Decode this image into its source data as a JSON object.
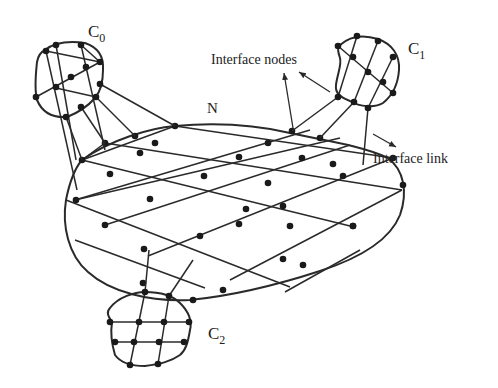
{
  "diagram": {
    "labels": {
      "c0": "C",
      "c0_sub": "0",
      "c1": "C",
      "c1_sub": "1",
      "c2": "C",
      "c2_sub": "2",
      "n": "N",
      "interface_nodes": "Interface nodes",
      "interface_link": "Interface link"
    },
    "colors": {
      "line": "#2a2a2a",
      "node": "#1a1a1a",
      "background": "#ffffff"
    },
    "components": [
      {
        "id": "N",
        "description": "central network (ellipse with mesh grid)"
      },
      {
        "id": "C0",
        "description": "upper-left cluster"
      },
      {
        "id": "C1",
        "description": "upper-right cluster"
      },
      {
        "id": "C2",
        "description": "bottom cluster"
      }
    ]
  }
}
